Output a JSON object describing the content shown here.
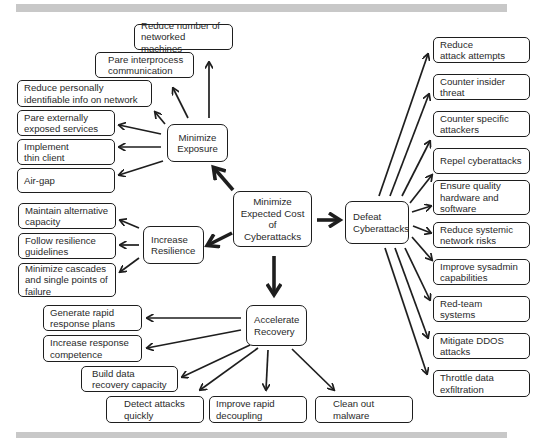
{
  "diagram": {
    "root": {
      "label": "Minimize\nExpected Cost\nof\nCyberattacks"
    },
    "branches": {
      "exposure": {
        "label": "Minimize\nExposure",
        "children": [
          "Reduce number of\nnetworked machines",
          "Pare interprocess\ncommunication",
          "Reduce personally\nidentifiable info on network",
          "Pare externally\nexposed services",
          "Implement\nthin client",
          "Air-gap"
        ]
      },
      "resilience": {
        "label": "Increase\nResilience",
        "children": [
          "Maintain alternative\ncapacity",
          "Follow resilience\nguidelines",
          "Minimize cascades\nand single points of\nfailure"
        ]
      },
      "recovery": {
        "label": "Accelerate\nRecovery",
        "children": [
          "Generate rapid\nresponse plans",
          "Increase response\ncompetence",
          "Build data\nrecovery capacity",
          "Detect attacks\nquickly",
          "Improve rapid\ndecoupling",
          "Clean out\nmalware"
        ]
      },
      "defeat": {
        "label": "Defeat\nCyberattacks",
        "children": [
          "Reduce\nattack attempts",
          "Counter insider\nthreat",
          "Counter specific\nattackers",
          "Repel cyberattacks",
          "Ensure quality\nhardware and\nsoftware",
          "Reduce  systemic\nnetwork risks",
          "Improve sysadmin\ncapabilities",
          "Red-team\nsystems",
          "Mitigate DDOS\nattacks",
          "Throttle data\nexfiltration"
        ]
      }
    },
    "colors": {
      "line": "#1e1e1e",
      "band": "#c8c8c8",
      "text": "#2a2a2a"
    }
  }
}
